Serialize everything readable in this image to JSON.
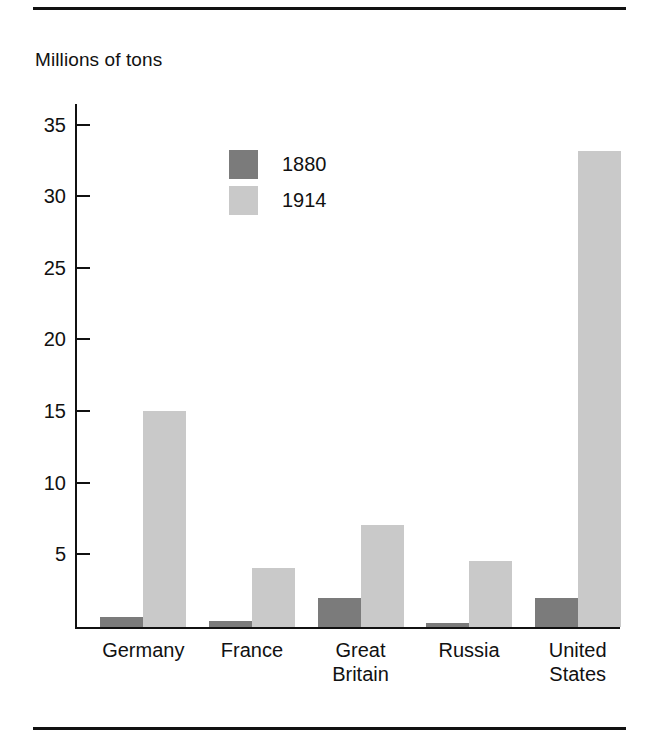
{
  "figure": {
    "y_axis_title": "Millions of tons",
    "top_rule": "horizontal-rule",
    "bottom_rule": "horizontal-rule"
  },
  "chart_data": {
    "type": "bar",
    "title": "",
    "subtitle": "",
    "xlabel": "",
    "ylabel": "Millions of tons",
    "ylim": [
      0,
      36.5
    ],
    "yticks": [
      5,
      10,
      15,
      20,
      25,
      30,
      35
    ],
    "ytick_labels": [
      "5",
      "10",
      "15",
      "20",
      "25",
      "30",
      "35"
    ],
    "grid": false,
    "legend_position": "upper-left-inside",
    "categories": [
      "Germany",
      "France",
      "Great\nBritain",
      "Russia",
      "United\nStates"
    ],
    "series": [
      {
        "name": "1880",
        "color": "#7b7b7b",
        "values": [
          0.7,
          0.4,
          2.0,
          0.3,
          2.0
        ]
      },
      {
        "name": "1914",
        "color": "#c9c9c9",
        "values": [
          15.1,
          4.1,
          7.1,
          4.6,
          33.2
        ]
      }
    ]
  }
}
